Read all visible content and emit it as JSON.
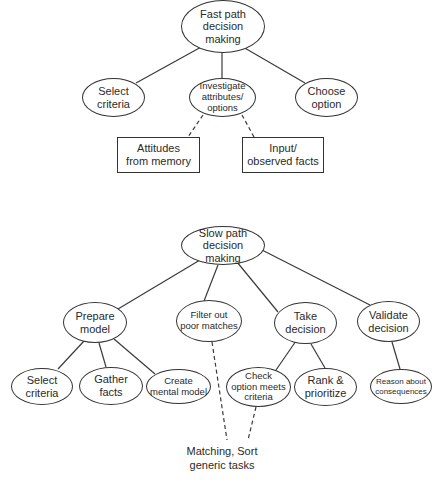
{
  "diagrams": {
    "fast_path": {
      "root": {
        "id": "fast-root",
        "label": "Fast path\ndecision\nmaking",
        "x": 181,
        "y": 0,
        "w": 84,
        "h": 53
      },
      "children": [
        {
          "id": "fast-select-criteria",
          "label": "Select\ncriteria",
          "x": 82,
          "y": 78,
          "w": 63,
          "h": 39
        },
        {
          "id": "fast-investigate",
          "label": "Investigate\nattributes/\noptions",
          "x": 189,
          "y": 78,
          "w": 67,
          "h": 39,
          "size": "small"
        },
        {
          "id": "fast-choose-option",
          "label": "Choose\noption",
          "x": 295,
          "y": 78,
          "w": 63,
          "h": 39
        }
      ],
      "inputs": [
        {
          "id": "fast-attitudes",
          "label": "Attitudes\nfrom memory",
          "x": 117,
          "y": 137,
          "w": 83,
          "h": 36
        },
        {
          "id": "fast-observed",
          "label": "Input/\nobserved facts",
          "x": 242,
          "y": 137,
          "w": 82,
          "h": 36
        }
      ]
    },
    "slow_path": {
      "root": {
        "id": "slow-root",
        "label": "Slow path\ndecision\nmaking",
        "x": 181,
        "y": 226,
        "w": 84,
        "h": 39
      },
      "level2": [
        {
          "id": "slow-prepare-model",
          "label": "Prepare\nmodel",
          "x": 63,
          "y": 302,
          "w": 64,
          "h": 41
        },
        {
          "id": "slow-filter-out",
          "label": "Filter out\npoor matches",
          "x": 176,
          "y": 300,
          "w": 66,
          "h": 42,
          "size": "small"
        },
        {
          "id": "slow-take-decision",
          "label": "Take\ndecision",
          "x": 274,
          "y": 302,
          "w": 63,
          "h": 42
        },
        {
          "id": "slow-validate-decision",
          "label": "Validate\ndecision",
          "x": 357,
          "y": 301,
          "w": 63,
          "h": 41
        }
      ],
      "level3": [
        {
          "id": "slow-select-criteria",
          "label": "Select\ncriteria",
          "x": 11,
          "y": 368,
          "w": 62,
          "h": 37
        },
        {
          "id": "slow-gather-facts",
          "label": "Gather\nfacts",
          "x": 79,
          "y": 367,
          "w": 64,
          "h": 38
        },
        {
          "id": "slow-create-mental-model",
          "label": "Create\nmental model",
          "x": 146,
          "y": 369,
          "w": 65,
          "h": 35,
          "size": "small"
        },
        {
          "id": "slow-check-option",
          "label": "Check\noption meets\ncriteria",
          "x": 226,
          "y": 367,
          "w": 65,
          "h": 40,
          "size": "small"
        },
        {
          "id": "slow-rank-prioritize",
          "label": "Rank &\nprioritize",
          "x": 294,
          "y": 368,
          "w": 63,
          "h": 38
        },
        {
          "id": "slow-reason-consequences",
          "label": "Reason about\nconsequences",
          "x": 370,
          "y": 369,
          "w": 62,
          "h": 35,
          "size": "tiny"
        }
      ],
      "footer_label": {
        "label": "Matching, Sort\ngeneric tasks",
        "x": 172,
        "y": 445,
        "w": 100
      }
    }
  },
  "edges": [
    {
      "from": [
        203,
        46
      ],
      "to": [
        136,
        83
      ],
      "style": "solid"
    },
    {
      "from": [
        222,
        53
      ],
      "to": [
        222,
        78
      ],
      "style": "solid"
    },
    {
      "from": [
        243,
        47
      ],
      "to": [
        305,
        83
      ],
      "style": "solid"
    },
    {
      "from": [
        203,
        115
      ],
      "to": [
        188,
        137
      ],
      "style": "dashed"
    },
    {
      "from": [
        242,
        115
      ],
      "to": [
        254,
        137
      ],
      "style": "dashed"
    },
    {
      "from": [
        200,
        260
      ],
      "to": [
        118,
        309
      ],
      "style": "solid"
    },
    {
      "from": [
        218,
        265
      ],
      "to": [
        204,
        301
      ],
      "style": "solid"
    },
    {
      "from": [
        237,
        262
      ],
      "to": [
        278,
        312
      ],
      "style": "solid"
    },
    {
      "from": [
        262,
        250
      ],
      "to": [
        370,
        305
      ],
      "style": "solid"
    },
    {
      "from": [
        84,
        341
      ],
      "to": [
        58,
        369
      ],
      "style": "solid"
    },
    {
      "from": [
        99,
        343
      ],
      "to": [
        106,
        367
      ],
      "style": "solid"
    },
    {
      "from": [
        114,
        339
      ],
      "to": [
        155,
        374
      ],
      "style": "solid"
    },
    {
      "from": [
        296,
        341
      ],
      "to": [
        276,
        370
      ],
      "style": "solid"
    },
    {
      "from": [
        311,
        344
      ],
      "to": [
        325,
        368
      ],
      "style": "solid"
    },
    {
      "from": [
        392,
        342
      ],
      "to": [
        400,
        369
      ],
      "style": "solid"
    },
    {
      "from": [
        212,
        342
      ],
      "to": [
        227,
        440
      ],
      "style": "dashed"
    },
    {
      "from": [
        256,
        407
      ],
      "to": [
        248,
        440
      ],
      "style": "dashed"
    }
  ]
}
